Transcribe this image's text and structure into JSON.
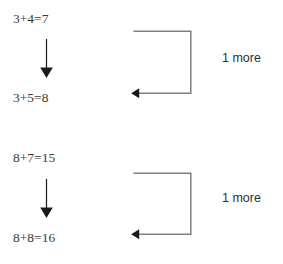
{
  "document": {
    "title": "Counting-on strategy worksheet diagram",
    "background_color": "#ffffff",
    "text_color": "#3a3a3a",
    "line_color": "#808080",
    "arrow_color": "#1a1a1a"
  },
  "groups": [
    {
      "id": "group-1",
      "first_equation": "3+4=7",
      "second_equation": "3+5=8",
      "annotation": "1 more",
      "down_arrow_icon": "down-arrow-icon",
      "bracket_icon": "left-pointing-bracket-arrow-icon"
    },
    {
      "id": "group-2",
      "first_equation": "8+7=15",
      "second_equation": "8+8=16",
      "annotation": "1 more",
      "down_arrow_icon": "down-arrow-icon",
      "bracket_icon": "left-pointing-bracket-arrow-icon"
    }
  ]
}
